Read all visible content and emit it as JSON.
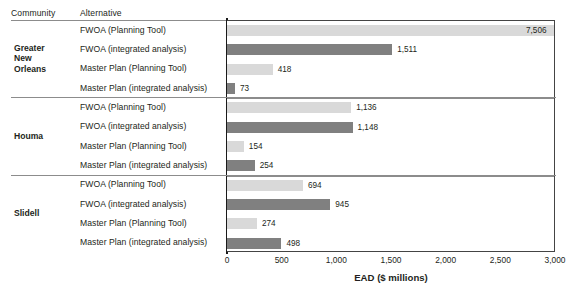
{
  "header": {
    "community_label": "Community",
    "alternative_label": "Alternative"
  },
  "axis": {
    "xlabel": "EAD ($ millions)",
    "ticks": [
      "0",
      "500",
      "1,000",
      "1,500",
      "2,000",
      "2,500",
      "3,000"
    ]
  },
  "groups": [
    {
      "community": "Greater\nNew\nOrleans",
      "rows": [
        {
          "alternative": "FWOA (Planning Tool)",
          "value": 7506,
          "value_label": "7,506",
          "shade": "light"
        },
        {
          "alternative": "FWOA (integrated analysis)",
          "value": 1511,
          "value_label": "1,511",
          "shade": "dark"
        },
        {
          "alternative": "Master Plan (Planning Tool)",
          "value": 418,
          "value_label": "418",
          "shade": "light"
        },
        {
          "alternative": "Master Plan (integrated analysis)",
          "value": 73,
          "value_label": "73",
          "shade": "dark"
        }
      ]
    },
    {
      "community": "Houma",
      "rows": [
        {
          "alternative": "FWOA (Planning Tool)",
          "value": 1136,
          "value_label": "1,136",
          "shade": "light"
        },
        {
          "alternative": "FWOA (integrated analysis)",
          "value": 1148,
          "value_label": "1,148",
          "shade": "dark"
        },
        {
          "alternative": "Master Plan (Planning Tool)",
          "value": 154,
          "value_label": "154",
          "shade": "light"
        },
        {
          "alternative": "Master Plan (integrated analysis)",
          "value": 254,
          "value_label": "254",
          "shade": "dark"
        }
      ]
    },
    {
      "community": "Slidell",
      "rows": [
        {
          "alternative": "FWOA (Planning Tool)",
          "value": 694,
          "value_label": "694",
          "shade": "light"
        },
        {
          "alternative": "FWOA (integrated analysis)",
          "value": 945,
          "value_label": "945",
          "shade": "dark"
        },
        {
          "alternative": "Master Plan (Planning Tool)",
          "value": 274,
          "value_label": "274",
          "shade": "light"
        },
        {
          "alternative": "Master Plan (integrated analysis)",
          "value": 498,
          "value_label": "498",
          "shade": "dark"
        }
      ]
    }
  ],
  "colors": {
    "light_bar": "#d9d9d9",
    "dark_bar": "#808080",
    "axis": "#1a1a1a",
    "separator": "#8c8c8c"
  },
  "chart_data": {
    "type": "bar",
    "title": "",
    "xlabel": "EAD ($ millions)",
    "ylabel": "",
    "orientation": "horizontal",
    "xlim": [
      0,
      3000
    ],
    "xticks": [
      0,
      500,
      1000,
      1500,
      2000,
      2500,
      3000
    ],
    "grid": false,
    "legend": "none",
    "note": "Top bar (7,506) exceeds the 3,000 axis maximum and is drawn clipped at the plot edge.",
    "categories": [
      "Greater New Orleans - FWOA (Planning Tool)",
      "Greater New Orleans - FWOA (integrated analysis)",
      "Greater New Orleans - Master Plan (Planning Tool)",
      "Greater New Orleans - Master Plan (integrated analysis)",
      "Houma - FWOA (Planning Tool)",
      "Houma - FWOA (integrated analysis)",
      "Houma - Master Plan (Planning Tool)",
      "Houma - Master Plan (integrated analysis)",
      "Slidell - FWOA (Planning Tool)",
      "Slidell - FWOA (integrated analysis)",
      "Slidell - Master Plan (Planning Tool)",
      "Slidell - Master Plan (integrated analysis)"
    ],
    "values": [
      7506,
      1511,
      418,
      73,
      1136,
      1148,
      154,
      254,
      694,
      945,
      274,
      498
    ]
  }
}
